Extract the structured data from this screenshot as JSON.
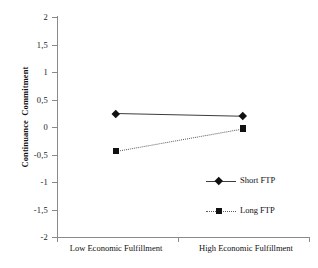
{
  "chart_data": {
    "type": "line",
    "title": "",
    "xlabel": "",
    "ylabel": "Continuance  Commitment",
    "categories": [
      "Low Economic Fulfillment",
      "High Economic Fulfillment"
    ],
    "ylim": [
      -2,
      2
    ],
    "yticks": [
      2,
      1.5,
      1,
      0.5,
      0,
      -0.5,
      -1,
      -1.5,
      -2
    ],
    "ytick_labels": [
      "2",
      "1,5",
      "1",
      "0,5",
      "0",
      "-0,5",
      "-1",
      "-1,5",
      "-2"
    ],
    "grid": false,
    "legend_position": "inside-right",
    "series": [
      {
        "name": "Short FTP",
        "values": [
          0.25,
          0.2
        ],
        "line_style": "solid",
        "marker": "diamond",
        "color": "#3d3d3d"
      },
      {
        "name": "Long FTP",
        "values": [
          -0.44,
          -0.03
        ],
        "line_style": "dotted",
        "marker": "square",
        "color": "#5a5a5a"
      }
    ]
  },
  "axes": {
    "y_title": "Continuance  Commitment",
    "y_tick_labels": [
      "2",
      "1,5",
      "1",
      "0,5",
      "0",
      "-0,5",
      "-1",
      "-1,5",
      "-2"
    ],
    "x_category_left": "Low Economic Fulfillment",
    "x_category_right": "High Economic Fulfillment"
  },
  "legend": {
    "entries": [
      {
        "label": "Short FTP"
      },
      {
        "label": "Long FTP"
      }
    ]
  },
  "colors": {
    "axis": "#8a8a8a",
    "short_ftp": "#3d3d3d",
    "long_ftp": "#5a5a5a",
    "marker": "#111111",
    "background": "#ffffff"
  }
}
